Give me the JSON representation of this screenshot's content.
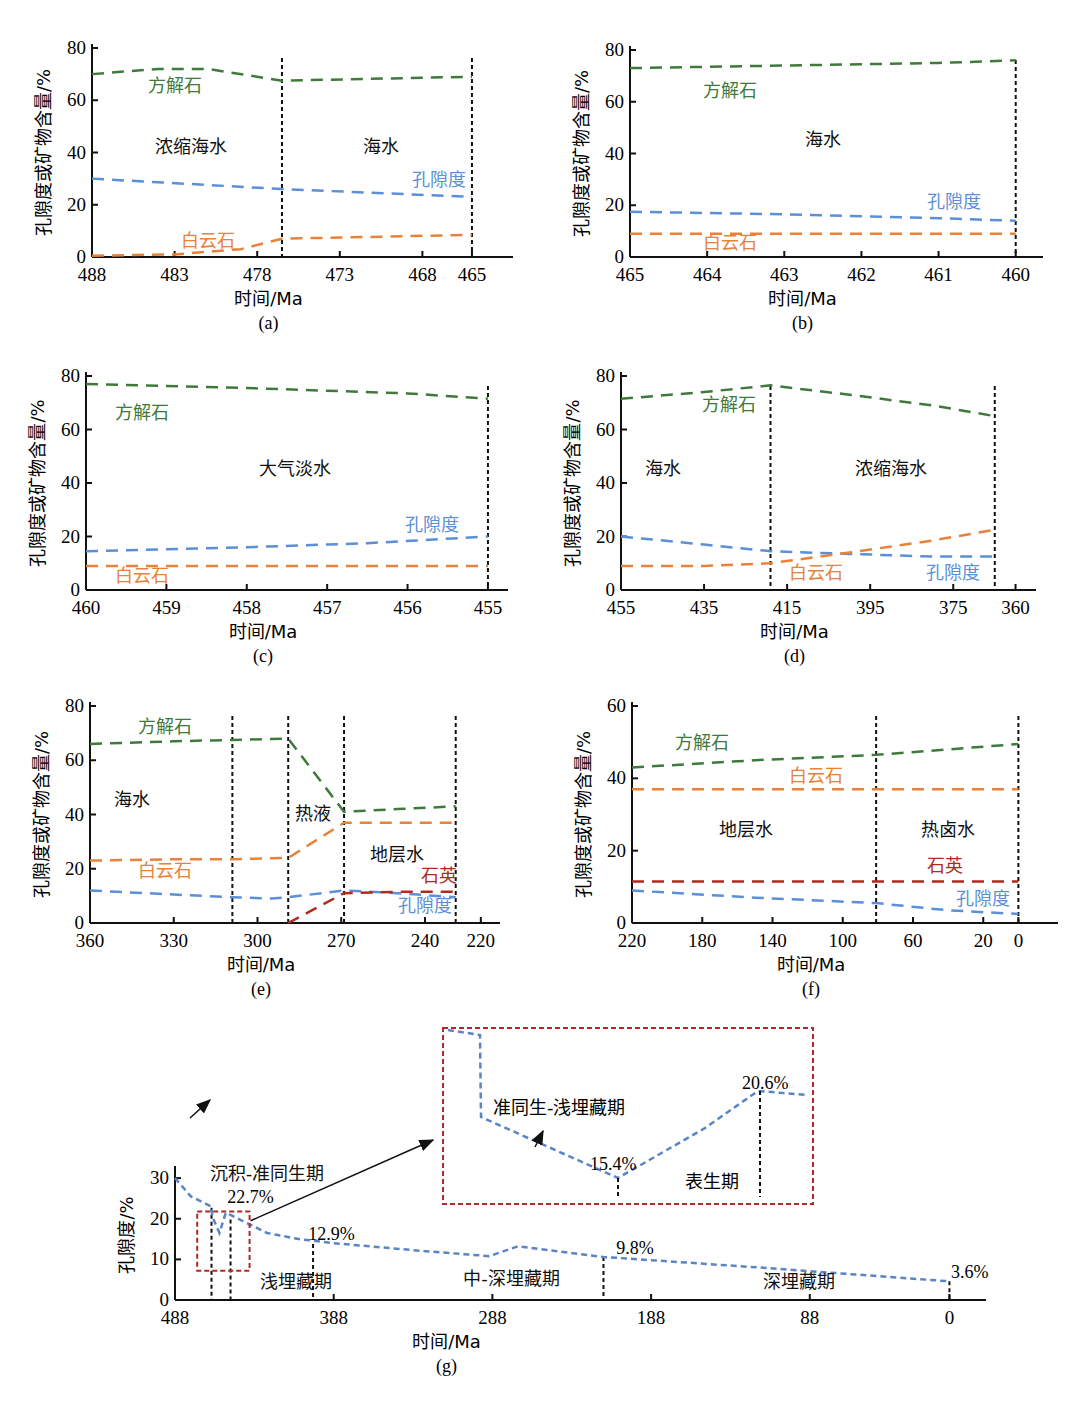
{
  "colors": {
    "calcite": "#3f7a3a",
    "porosity": "#5b8fd6",
    "dolomite": "#e8823a",
    "quartz": "#b02a1e",
    "boundary": "#111111",
    "zoom_box": "#b0282a",
    "g_porosity": "#5b84c4"
  },
  "common": {
    "y_label": "孔隙度或矿物含量/%",
    "x_label": "时间/Ma"
  },
  "chart_data": [
    {
      "id": "a",
      "type": "line",
      "caption": "(a)",
      "title": "",
      "xlabel": "时间/Ma",
      "ylabel": "孔隙度或矿物含量/%",
      "x_ticks": [
        488,
        483,
        478,
        473,
        468,
        465
      ],
      "y_ticks": [
        0,
        20,
        40,
        60,
        80
      ],
      "xlim": [
        488,
        463
      ],
      "ylim": [
        0,
        80
      ],
      "boundaries": [
        476.5,
        465
      ],
      "zones": [
        {
          "label": "浓缩海水",
          "x": 482,
          "y": 40
        },
        {
          "label": "海水",
          "x": 470.5,
          "y": 40
        }
      ],
      "series": [
        {
          "name": "方解石",
          "color_key": "calcite",
          "points": [
            [
              488,
              70
            ],
            [
              484,
              72
            ],
            [
              481,
              72
            ],
            [
              476.5,
              67.5
            ],
            [
              465,
              69
            ]
          ],
          "label_pos": [
            483,
            63
          ]
        },
        {
          "name": "孔隙度",
          "color_key": "porosity",
          "points": [
            [
              488,
              30
            ],
            [
              476.5,
              26
            ],
            [
              465,
              23
            ]
          ],
          "label_pos": [
            467,
            27
          ]
        },
        {
          "name": "白云石",
          "color_key": "dolomite",
          "points": [
            [
              488,
              0.5
            ],
            [
              483,
              1
            ],
            [
              479,
              3
            ],
            [
              476.5,
              7
            ],
            [
              465,
              8.5
            ]
          ],
          "label_pos": [
            481,
            4
          ]
        }
      ]
    },
    {
      "id": "b",
      "type": "line",
      "caption": "(b)",
      "title": "",
      "xlabel": "时间/Ma",
      "ylabel": "孔隙度或矿物含量/%",
      "x_ticks": [
        465,
        464,
        463,
        462,
        461,
        460
      ],
      "y_ticks": [
        0,
        20,
        40,
        60,
        80
      ],
      "xlim": [
        465,
        459.75
      ],
      "ylim": [
        0,
        80
      ],
      "boundaries": [
        460
      ],
      "zones": [
        {
          "label": "海水",
          "x": 462.5,
          "y": 43
        }
      ],
      "series": [
        {
          "name": "方解石",
          "color_key": "calcite",
          "points": [
            [
              465,
              73
            ],
            [
              463,
              74
            ],
            [
              461,
              75
            ],
            [
              460,
              76
            ]
          ],
          "label_pos": [
            463.7,
            62
          ]
        },
        {
          "name": "孔隙度",
          "color_key": "porosity",
          "points": [
            [
              465,
              17.5
            ],
            [
              463,
              16.5
            ],
            [
              461,
              15
            ],
            [
              460,
              14
            ]
          ],
          "label_pos": [
            460.8,
            19
          ]
        },
        {
          "name": "白云石",
          "color_key": "dolomite",
          "points": [
            [
              465,
              9
            ],
            [
              460,
              9
            ]
          ],
          "label_pos": [
            463.7,
            3
          ]
        }
      ]
    },
    {
      "id": "c",
      "type": "line",
      "caption": "(c)",
      "title": "",
      "xlabel": "时间/Ma",
      "ylabel": "孔隙度或矿物含量/%",
      "x_ticks": [
        460,
        459,
        458,
        457,
        456,
        455
      ],
      "y_ticks": [
        0,
        20,
        40,
        60,
        80
      ],
      "xlim": [
        460,
        454.85
      ],
      "ylim": [
        0,
        80
      ],
      "boundaries": [
        455
      ],
      "zones": [
        {
          "label": "大气淡水",
          "x": 457.4,
          "y": 43
        }
      ],
      "series": [
        {
          "name": "方解石",
          "color_key": "calcite",
          "points": [
            [
              460,
              77
            ],
            [
              458,
              75.5
            ],
            [
              456,
              73.5
            ],
            [
              455,
              71.5
            ]
          ],
          "label_pos": [
            459.3,
            64
          ]
        },
        {
          "name": "孔隙度",
          "color_key": "porosity",
          "points": [
            [
              460,
              14.5
            ],
            [
              458,
              16
            ],
            [
              456.5,
              17.5
            ],
            [
              455,
              20
            ]
          ],
          "label_pos": [
            455.7,
            22
          ]
        },
        {
          "name": "白云石",
          "color_key": "dolomite",
          "points": [
            [
              460,
              9
            ],
            [
              455,
              9
            ]
          ],
          "label_pos": [
            459.3,
            3
          ]
        }
      ]
    },
    {
      "id": "d",
      "type": "line",
      "caption": "(d)",
      "title": "",
      "xlabel": "时间/Ma",
      "ylabel": "孔隙度或矿物含量/%",
      "x_ticks": [
        455,
        435,
        415,
        395,
        375,
        360
      ],
      "y_ticks": [
        0,
        20,
        40,
        60,
        80
      ],
      "xlim": [
        455,
        357
      ],
      "ylim": [
        0,
        80
      ],
      "boundaries": [
        419,
        365
      ],
      "zones": [
        {
          "label": "海水",
          "x": 445,
          "y": 43
        },
        {
          "label": "浓缩海水",
          "x": 390,
          "y": 43
        }
      ],
      "series": [
        {
          "name": "方解石",
          "color_key": "calcite",
          "points": [
            [
              455,
              71.5
            ],
            [
              435,
              74
            ],
            [
              419,
              76.5
            ],
            [
              400,
              73
            ],
            [
              380,
              69
            ],
            [
              365,
              65
            ]
          ],
          "label_pos": [
            429,
            67
          ]
        },
        {
          "name": "孔隙度",
          "color_key": "porosity",
          "points": [
            [
              455,
              20
            ],
            [
              435,
              17
            ],
            [
              419,
              14.5
            ],
            [
              400,
              13.5
            ],
            [
              380,
              12.5
            ],
            [
              365,
              12.5
            ]
          ],
          "label_pos": [
            375,
            4
          ]
        },
        {
          "name": "白云石",
          "color_key": "dolomite",
          "points": [
            [
              455,
              9
            ],
            [
              435,
              9
            ],
            [
              419,
              10
            ],
            [
              400,
              14
            ],
            [
              380,
              18.5
            ],
            [
              365,
              22.5
            ]
          ],
          "label_pos": [
            408,
            4
          ]
        }
      ]
    },
    {
      "id": "e",
      "type": "line",
      "caption": "(e)",
      "title": "",
      "xlabel": "时间/Ma",
      "ylabel": "孔隙度或矿物含量/%",
      "x_ticks": [
        360,
        330,
        300,
        270,
        240,
        220
      ],
      "y_ticks": [
        0,
        20,
        40,
        60,
        80
      ],
      "xlim": [
        360,
        216
      ],
      "ylim": [
        0,
        80
      ],
      "boundaries": [
        309,
        289,
        269,
        229
      ],
      "zones": [
        {
          "label": "海水",
          "x": 345,
          "y": 43
        },
        {
          "label": "热液",
          "x": 280,
          "y": 38
        },
        {
          "label": "地层水",
          "x": 250,
          "y": 23
        }
      ],
      "series": [
        {
          "name": "方解石",
          "color_key": "calcite",
          "points": [
            [
              360,
              66
            ],
            [
              330,
              67
            ],
            [
              309,
              67.5
            ],
            [
              289,
              68
            ],
            [
              269,
              41
            ],
            [
              250,
              42
            ],
            [
              229,
              43
            ]
          ],
          "label_pos": [
            333,
            70
          ]
        },
        {
          "name": "白云石",
          "color_key": "dolomite",
          "points": [
            [
              360,
              23
            ],
            [
              330,
              23.5
            ],
            [
              309,
              23.5
            ],
            [
              289,
              24
            ],
            [
              272,
              35
            ],
            [
              269,
              37
            ],
            [
              250,
              37
            ],
            [
              229,
              37
            ]
          ],
          "label_pos": [
            333,
            17
          ]
        },
        {
          "name": "孔隙度",
          "color_key": "porosity",
          "points": [
            [
              360,
              12
            ],
            [
              330,
              10.5
            ],
            [
              309,
              9.5
            ],
            [
              295,
              9
            ],
            [
              289,
              9.5
            ],
            [
              269,
              12
            ],
            [
              250,
              11
            ],
            [
              229,
              9.5
            ]
          ],
          "label_pos": [
            240,
            4
          ]
        },
        {
          "name": "石英",
          "color_key": "quartz",
          "points": [
            [
              289,
              0
            ],
            [
              269,
              11
            ],
            [
              250,
              11.5
            ],
            [
              229,
              11.5
            ]
          ],
          "label_pos": [
            235,
            15
          ]
        }
      ]
    },
    {
      "id": "f",
      "type": "line",
      "caption": "(f)",
      "title": "",
      "xlabel": "时间/Ma",
      "ylabel": "孔隙度或矿物含量/%",
      "x_ticks": [
        220,
        180,
        140,
        100,
        60,
        20,
        0
      ],
      "y_ticks": [
        0,
        20,
        40,
        60
      ],
      "xlim": [
        220,
        -18
      ],
      "ylim": [
        0,
        60
      ],
      "boundaries": [
        81,
        0
      ],
      "zones": [
        {
          "label": "地层水",
          "x": 155,
          "y": 24
        },
        {
          "label": "热卤水",
          "x": 40,
          "y": 24
        }
      ],
      "series": [
        {
          "name": "方解石",
          "color_key": "calcite",
          "points": [
            [
              220,
              43
            ],
            [
              150,
              45
            ],
            [
              81,
              46.5
            ],
            [
              40,
              48
            ],
            [
              0,
              49.5
            ]
          ],
          "label_pos": [
            180,
            48
          ]
        },
        {
          "name": "白云石",
          "color_key": "dolomite",
          "points": [
            [
              220,
              37
            ],
            [
              0,
              37
            ]
          ],
          "label_pos": [
            115,
            39
          ]
        },
        {
          "name": "石英",
          "color_key": "quartz",
          "points": [
            [
              220,
              11.5
            ],
            [
              0,
              11.5
            ]
          ],
          "label_pos": [
            42,
            14
          ]
        },
        {
          "name": "孔隙度",
          "color_key": "porosity",
          "points": [
            [
              220,
              9
            ],
            [
              150,
              7
            ],
            [
              81,
              5.5
            ],
            [
              40,
              3.5
            ],
            [
              0,
              2.5
            ]
          ],
          "label_pos": [
            20,
            5
          ]
        }
      ]
    },
    {
      "id": "g",
      "type": "line",
      "caption": "(g)",
      "title": "",
      "xlabel": "时间/Ma",
      "ylabel": "孔隙度/%",
      "x_ticks": [
        488,
        388,
        288,
        188,
        88,
        0
      ],
      "y_ticks": [
        0,
        10,
        20,
        30
      ],
      "xlim": [
        488,
        -18
      ],
      "ylim": [
        0,
        32
      ],
      "boundaries": [
        {
          "x": 465,
          "top": 22.7
        },
        {
          "x": 453,
          "top": 19.8
        },
        {
          "x": 401,
          "top": 13.8
        },
        {
          "x": 218,
          "top": 10.6
        },
        {
          "x": 0,
          "top": 4.6
        }
      ],
      "annotations": [
        {
          "text": "22.7%",
          "x": 455,
          "y": 23.8
        },
        {
          "text": "12.9%",
          "x": 404,
          "y": 14.8
        },
        {
          "text": "9.8%",
          "x": 210,
          "y": 11.3
        },
        {
          "text": "3.6%",
          "x": -1,
          "y": 5.4
        }
      ],
      "zones": [
        {
          "label": "沉积-准同生期",
          "x": 430,
          "y": 29.5
        },
        {
          "label": "浅埋藏期",
          "x": 412,
          "y": 3
        },
        {
          "label": "中-深埋藏期",
          "x": 276,
          "y": 3.8
        },
        {
          "label": "深埋藏期",
          "x": 95,
          "y": 3
        }
      ],
      "series": [
        {
          "name": "孔隙度",
          "color_key": "g_porosity",
          "points": [
            [
              488,
              30
            ],
            [
              478,
              25.5
            ],
            [
              465,
              23
            ],
            [
              464.5,
              20.5
            ],
            [
              460,
              16.5
            ],
            [
              456,
              21.5
            ],
            [
              430,
              16.5
            ],
            [
              410,
              15
            ],
            [
              388,
              14
            ],
            [
              330,
              12
            ],
            [
              290,
              10.8
            ],
            [
              272,
              13.2
            ],
            [
              218,
              10.6
            ],
            [
              120,
              8
            ],
            [
              0,
              4.6
            ]
          ]
        }
      ],
      "zoom_box": {
        "x0": 474,
        "x1": 441,
        "y0": 7.2,
        "y1": 21.8
      },
      "inset": {
        "zones": [
          {
            "label": "准同生-浅埋藏期"
          },
          {
            "label": "表生期"
          }
        ],
        "annotations": [
          "15.4%",
          "20.6%"
        ]
      }
    }
  ]
}
